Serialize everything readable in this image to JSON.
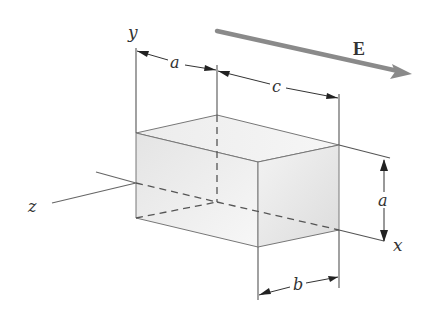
{
  "figure": {
    "labels": {
      "y_axis": "y",
      "x_axis": "x",
      "z_axis": "z",
      "field": "E",
      "dim_a_top": "a",
      "dim_c": "c",
      "dim_a_right": "a",
      "dim_b": "b"
    },
    "colors": {
      "line": "#555555",
      "box_fill_light": "#f4f4f4",
      "box_fill_dark": "#dcdcdc",
      "field_arrow": "#808080"
    }
  }
}
